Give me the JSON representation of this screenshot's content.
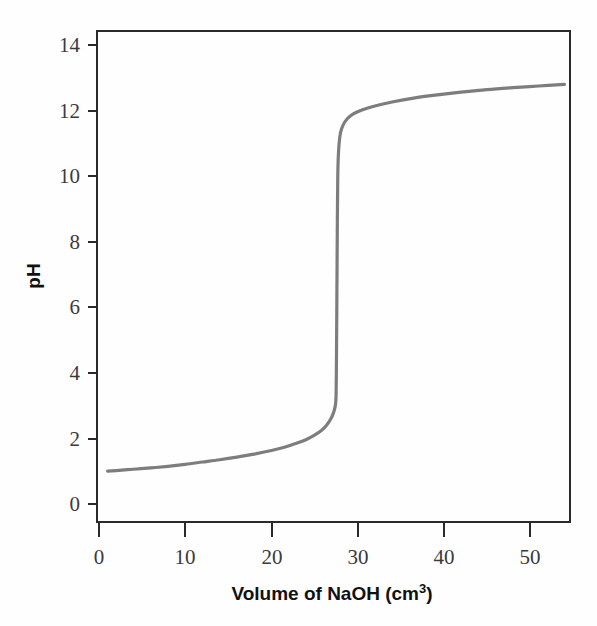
{
  "chart_data": {
    "type": "line",
    "title": "",
    "xlabel": "Volume of NaOH (cm3)",
    "xlabel_display": "Volume of NaOH (cm",
    "xlabel_superscript": "3",
    "xlabel_suffix": ")",
    "ylabel": "pH",
    "xlim": [
      0,
      54
    ],
    "ylim": [
      0,
      14.5
    ],
    "xticks": [
      0,
      10,
      20,
      30,
      40,
      50
    ],
    "yticks": [
      0,
      2,
      4,
      6,
      8,
      10,
      12,
      14
    ],
    "xtick_labels": [
      "0",
      "10",
      "20",
      "30",
      "40",
      "50"
    ],
    "ytick_labels": [
      "0",
      "2",
      "4",
      "6",
      "8",
      "10",
      "12",
      "14"
    ],
    "grid": false,
    "legend": false,
    "series": [
      {
        "name": "Titration curve",
        "color": "#7d7d7d",
        "x": [
          1.0,
          2.0,
          4.0,
          6.0,
          8.0,
          10.0,
          12.0,
          14.0,
          16.0,
          18.0,
          20.0,
          21.5,
          23.0,
          24.0,
          25.0,
          25.8,
          26.4,
          26.9,
          27.2,
          27.4,
          27.5,
          27.55,
          27.6,
          27.65,
          27.7,
          27.8,
          28.0,
          28.3,
          28.8,
          29.5,
          30.5,
          32.0,
          34.0,
          36.5,
          39.0,
          42.0,
          45.0,
          48.0,
          51.0,
          54.0
        ],
        "y": [
          1.0,
          1.02,
          1.06,
          1.1,
          1.15,
          1.21,
          1.28,
          1.35,
          1.43,
          1.52,
          1.63,
          1.73,
          1.86,
          1.96,
          2.1,
          2.24,
          2.4,
          2.6,
          2.78,
          2.98,
          3.3,
          4.5,
          6.5,
          8.6,
          10.0,
          10.8,
          11.3,
          11.55,
          11.75,
          11.9,
          12.02,
          12.14,
          12.26,
          12.38,
          12.47,
          12.56,
          12.64,
          12.7,
          12.75,
          12.8
        ]
      }
    ],
    "annotations": {
      "equivalence_volume": 27.6,
      "initial_pH": 1.0,
      "final_pH": 12.8
    }
  },
  "axes": {
    "x_axis_name": "volume-axis",
    "y_axis_name": "ph-axis"
  }
}
